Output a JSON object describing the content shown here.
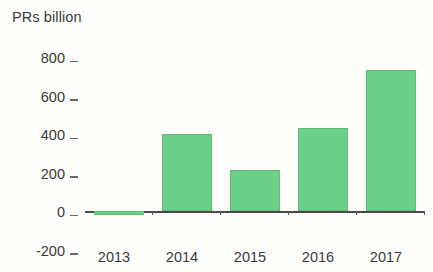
{
  "chart_data": {
    "type": "bar",
    "title": "PRs billion",
    "xlabel": "",
    "ylabel": "",
    "categories": [
      "2013",
      "2014",
      "2015",
      "2016",
      "2017"
    ],
    "values": [
      -20,
      400,
      215,
      430,
      730
    ],
    "series": [
      {
        "name": "PRs billion",
        "values": [
          -20,
          400,
          215,
          430,
          730
        ]
      }
    ],
    "ylim": [
      -200,
      800
    ],
    "y_ticks": [
      "800",
      "600",
      "400",
      "200",
      "0",
      "-200"
    ],
    "y_tick_values": [
      800,
      600,
      400,
      200,
      0,
      -200
    ],
    "grid": false,
    "legend": false,
    "legend_position": "none",
    "bar_color": "#6dd08a",
    "bar_edge_color": "#5cbd79",
    "axis_color": "#4a4a4a",
    "text_color": "#3a3a3a",
    "background_color": "#fdfdfc",
    "annotations": []
  }
}
